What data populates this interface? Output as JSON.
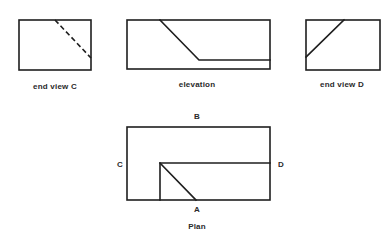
{
  "views": {
    "end_view_c": {
      "caption": "end view C"
    },
    "elevation": {
      "caption": "elevation"
    },
    "end_view_d": {
      "caption": "end view D"
    },
    "plan": {
      "caption": "Plan",
      "markers": {
        "a": "A",
        "b": "B",
        "c": "C",
        "d": "D"
      }
    }
  },
  "colors": {
    "line": "#1f1f1f",
    "background": "#ffffff"
  }
}
